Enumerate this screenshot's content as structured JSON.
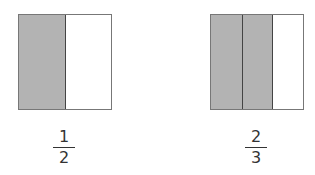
{
  "figures": [
    {
      "numerator": "1",
      "denominator": "2",
      "parts": 2,
      "shaded": 1,
      "shade_color": "#b3b3b3"
    },
    {
      "numerator": "2",
      "denominator": "3",
      "parts": 3,
      "shaded": 2,
      "shade_color": "#b3b3b3"
    }
  ]
}
